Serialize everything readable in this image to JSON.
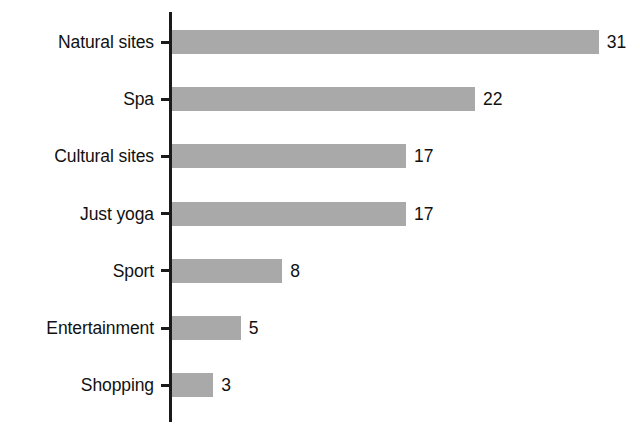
{
  "chart_data": {
    "type": "bar",
    "orientation": "horizontal",
    "title": "",
    "subtitle": "",
    "xlabel": "",
    "ylabel": "",
    "categories": [
      "Natural sites",
      "Spa",
      "Cultural sites",
      "Just yoga",
      "Sport",
      "Entertainment",
      "Shopping"
    ],
    "values": [
      31,
      22,
      17,
      17,
      8,
      5,
      3
    ],
    "data_labels": [
      "31",
      "22",
      "17",
      "17",
      "8",
      "5",
      "3"
    ],
    "xlim": [
      0,
      31
    ],
    "ylim": [
      0,
      7
    ],
    "grid": false,
    "legend": false,
    "legend_position": "none",
    "tick_labels_x": [],
    "annotations": [],
    "colors": {
      "bar_fill": "#a9a9a9",
      "axis": "#1a1a1a",
      "text": "#111111",
      "background": "#ffffff"
    }
  },
  "axis": {
    "tick_marker": "tick-mark"
  }
}
